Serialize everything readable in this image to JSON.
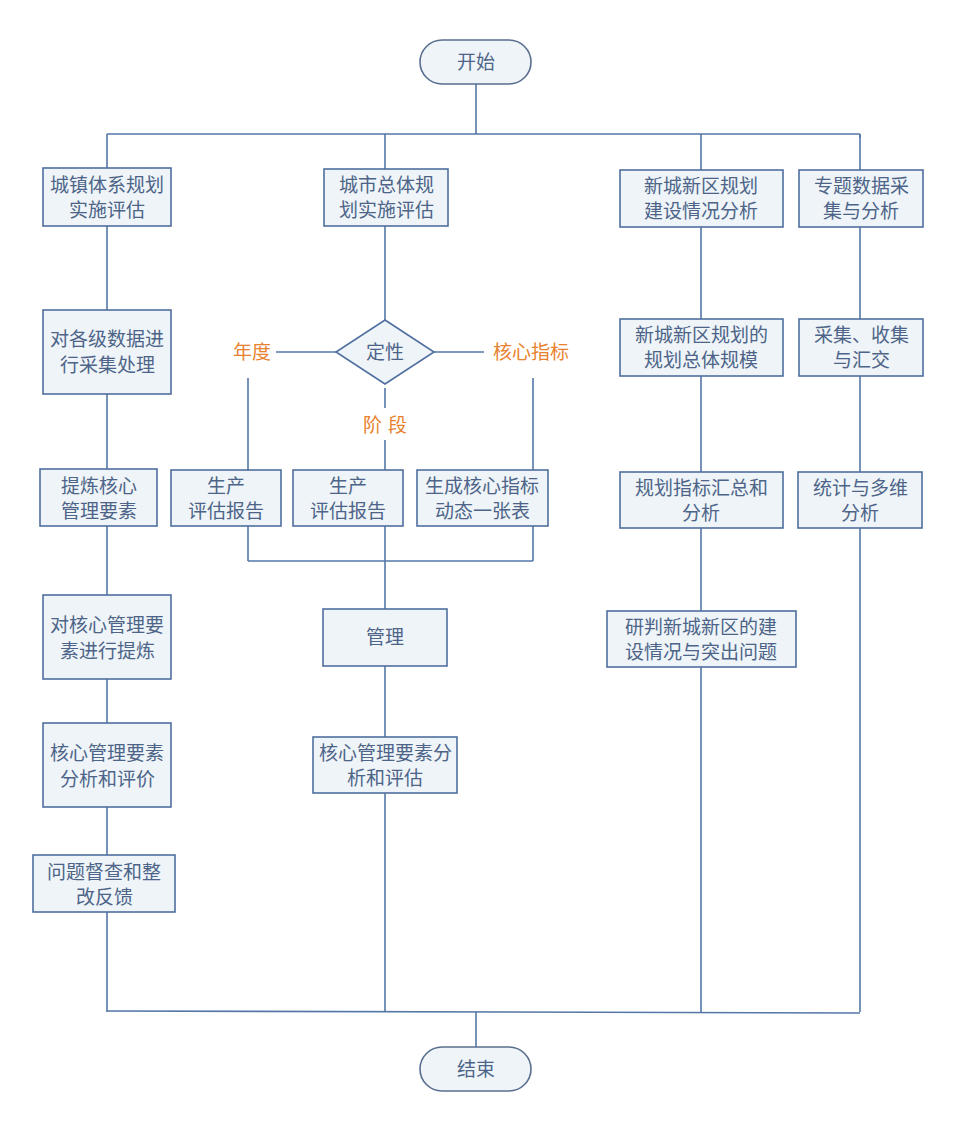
{
  "colors": {
    "node_fill": "#eef4f8",
    "node_stroke": "#4f6f9f",
    "edge": "#5577a8",
    "text": "#4d6488",
    "branch_text": "#e8822e"
  },
  "start": {
    "label": "开始"
  },
  "end": {
    "label": "结束"
  },
  "columns": [
    {
      "id": "col1",
      "nodes": [
        {
          "lines": [
            "城镇体系规划",
            "实施评估"
          ]
        },
        {
          "lines": [
            "对各级数据进",
            "行采集处理"
          ]
        },
        {
          "lines": [
            "提炼核心",
            "管理要素"
          ]
        },
        {
          "lines": [
            "对核心管理要",
            "素进行提炼"
          ]
        },
        {
          "lines": [
            "核心管理要素",
            "分析和评价"
          ]
        },
        {
          "lines": [
            "问题督查和整",
            "改反馈"
          ]
        }
      ]
    },
    {
      "id": "col2",
      "head": {
        "lines": [
          "城市总体规",
          "划实施评估"
        ]
      },
      "decision": {
        "label": "定性"
      },
      "branches": {
        "left": "年度",
        "down": "阶 段",
        "right": "核心指标"
      },
      "outputs": [
        {
          "lines": [
            "生产",
            "评估报告"
          ]
        },
        {
          "lines": [
            "生产",
            "评估报告"
          ]
        },
        {
          "lines": [
            "生成核心指标",
            "动态一张表"
          ]
        }
      ],
      "after": [
        {
          "lines": [
            "管理"
          ]
        },
        {
          "lines": [
            "核心管理要素分",
            "析和评估"
          ]
        }
      ]
    },
    {
      "id": "col3",
      "nodes": [
        {
          "lines": [
            "新城新区规划",
            "建设情况分析"
          ]
        },
        {
          "lines": [
            "新城新区规划的",
            "规划总体规模"
          ]
        },
        {
          "lines": [
            "规划指标汇总和",
            "分析"
          ]
        },
        {
          "lines": [
            "研判新城新区的建",
            "设情况与突出问题"
          ]
        }
      ]
    },
    {
      "id": "col4",
      "nodes": [
        {
          "lines": [
            "专题数据采",
            "集与分析"
          ]
        },
        {
          "lines": [
            "采集、收集",
            "与汇交"
          ]
        },
        {
          "lines": [
            "统计与多维",
            "分析"
          ]
        }
      ]
    }
  ]
}
